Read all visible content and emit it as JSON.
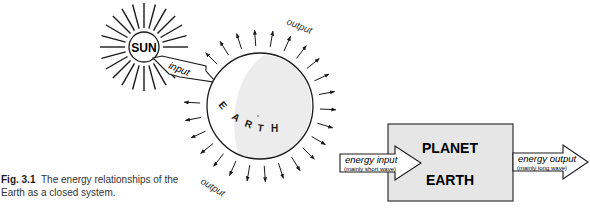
{
  "figure": {
    "number": "Fig. 3.1",
    "caption": "The energy relationships of the Earth as a closed system."
  },
  "left_diagram": {
    "sun_label": "SUN",
    "input_label": "input",
    "earth_letters": [
      "E",
      "A",
      "R",
      "T",
      "H"
    ],
    "output_label_top": "output",
    "output_label_bottom": "output"
  },
  "right_diagram": {
    "box_title_line1": "PLANET",
    "box_title_line2": "EARTH",
    "input_arrow": {
      "label": "energy input",
      "sublabel": "(mainly short wave)"
    },
    "output_arrow": {
      "label": "energy output",
      "sublabel": "(mainly long wave)"
    }
  },
  "colors": {
    "line": "#1a1a1a",
    "box_fill": "#e6e6e6",
    "earth_shade": "#ececec"
  }
}
